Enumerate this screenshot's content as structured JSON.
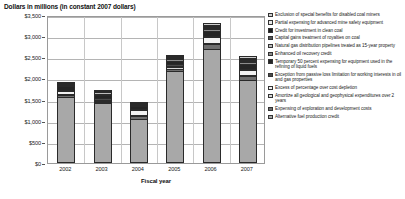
{
  "chart_data": {
    "type": "bar",
    "stacked": true,
    "title": "Dollars in millions (in constant 2007 dollars)",
    "xlabel": "Fiscal year",
    "ylabel": "",
    "grid": true,
    "legend_position": "right",
    "categories": [
      "2002",
      "2003",
      "2004",
      "2005",
      "2006",
      "2007"
    ],
    "ylim": [
      0,
      3500
    ],
    "yticks": [
      0,
      500,
      1000,
      1500,
      2000,
      2500,
      3000,
      3500
    ],
    "ytick_labels": [
      "$0",
      "$500",
      "$1,000",
      "$1,500",
      "$2,000",
      "$2,500",
      "$3,000",
      "$3,500"
    ],
    "series": [
      {
        "name": "Alternative fuel production credit",
        "color": "#a8a8a8",
        "values": [
          1570,
          1410,
          1050,
          2180,
          2700,
          1960
        ]
      },
      {
        "name": "Expensing of exploration and development costs",
        "color": "#6e6e6e",
        "values": [
          40,
          35,
          60,
          55,
          110,
          95
        ]
      },
      {
        "name": "Amortize all geological and geophysical expenditures over 2 years",
        "color": "#d8d8d8",
        "values": [
          25,
          20,
          30,
          25,
          35,
          30
        ]
      },
      {
        "name": "Excess of percentage over cost depletion",
        "color": "#f2f2f2",
        "values": [
          70,
          25,
          110,
          40,
          130,
          120
        ]
      },
      {
        "name": "Exception from passive loss limitation for working interests in oil and gas properties",
        "color": "#4a4a4a",
        "values": [
          20,
          20,
          20,
          25,
          30,
          25
        ]
      },
      {
        "name": "Temporary 50 percent expensing for equipment used in the refining of liquid fuels",
        "color": "#252525",
        "values": [
          75,
          85,
          60,
          90,
          130,
          120
        ]
      },
      {
        "name": "Enhanced oil recovery credit",
        "color": "#8c8c8c",
        "values": [
          15,
          10,
          10,
          10,
          15,
          15
        ]
      },
      {
        "name": "Natural gas distribution pipelines treated as 15-year property",
        "color": "#bdbdbd",
        "values": [
          5,
          5,
          5,
          10,
          15,
          15
        ]
      },
      {
        "name": "Capital gains treatment of royalties on coal",
        "color": "#555555",
        "values": [
          5,
          5,
          5,
          5,
          10,
          10
        ]
      },
      {
        "name": "Credit for investment in clean coal",
        "color": "#1c1c1c",
        "values": [
          0,
          0,
          0,
          5,
          10,
          10
        ]
      },
      {
        "name": "Partial expensing for advanced mine safety equipment",
        "color": "#e8e8e8",
        "values": [
          0,
          0,
          0,
          0,
          5,
          5
        ]
      },
      {
        "name": "Exclusion of special benefits for disabled coal miners",
        "color": "#cfcfcf",
        "values": [
          5,
          5,
          5,
          5,
          5,
          5
        ]
      }
    ],
    "legend_order": [
      "Exclusion of special benefits for disabled coal miners",
      "Partial expensing for advanced mine safety equipment",
      "Credit for investment in clean coal",
      "Capital gains treatment of royalties on coal",
      "Natural gas distribution pipelines treated as 15-year property",
      "Enhanced oil recovery credit",
      "Temporary 50 percent expensing for equipment used in the refining of liquid fuels",
      "Exception from passive loss limitation for working interests in oil and gas properties",
      "Excess of percentage over cost depletion",
      "Amortize all geological and geophysical expenditures over 2 years",
      "Expensing of exploration and development costs",
      "Alternative fuel production credit"
    ]
  }
}
